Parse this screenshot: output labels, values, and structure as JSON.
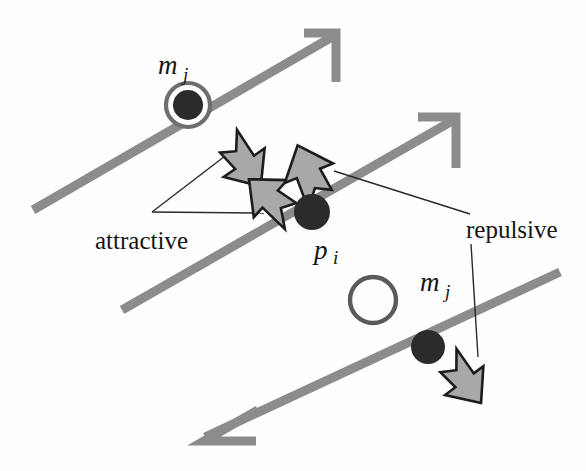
{
  "figure": {
    "background_color": "#fefefe"
  },
  "colors": {
    "trajectory": "#8c8c8c",
    "force_arrow_fill": "#a8a8a8",
    "force_arrow_stroke": "#1c1c1c",
    "node_fill": "#2b2b2b",
    "node_ring": "#6e6e6e",
    "leader_line": "#2a2a2a",
    "text": "#141414"
  },
  "labels": {
    "attractive": "attractive",
    "repulsive": "repulsive",
    "m_top": {
      "base": "m",
      "sub": "j"
    },
    "m_bottom": {
      "base": "m",
      "sub": "j"
    },
    "p_center": {
      "base": "p",
      "sub": "i"
    }
  },
  "trajectories": [
    {
      "name": "upper-trajectory",
      "x1": 33,
      "y1": 210,
      "x2": 330,
      "y2": 38,
      "arrow_direction": "up-right"
    },
    {
      "name": "middle-trajectory",
      "x1": 122,
      "y1": 310,
      "x2": 450,
      "y2": 122,
      "arrow_direction": "up-right"
    },
    {
      "name": "lower-trajectory",
      "x1": 205,
      "y1": 435,
      "x2": 560,
      "y2": 272,
      "arrow_direction": "down-left"
    }
  ],
  "nodes": [
    {
      "name": "m-j-upper",
      "type": "ringed-dot",
      "cx": 188,
      "cy": 105,
      "r": 15,
      "ring_r": 23
    },
    {
      "name": "p-i-center",
      "type": "filled-dot",
      "cx": 312,
      "cy": 212,
      "r": 18
    },
    {
      "name": "open-circle",
      "type": "open-circle",
      "cx": 373,
      "cy": 300,
      "r": 24
    },
    {
      "name": "m-j-lower",
      "type": "filled-dot",
      "cx": 428,
      "cy": 347,
      "r": 17
    }
  ],
  "force_arrows": [
    {
      "name": "attractive-arrow-upper",
      "force": "attractive",
      "cx": 243,
      "cy": 163,
      "angle": 135,
      "scale": 1.0
    },
    {
      "name": "attractive-arrow-lower",
      "force": "attractive",
      "cx": 273,
      "cy": 200,
      "angle": -50,
      "scale": 0.92
    },
    {
      "name": "repulsive-arrow-center",
      "force": "repulsive",
      "cx": 309,
      "cy": 177,
      "angle": -23,
      "scale": 1.0
    },
    {
      "name": "repulsive-arrow-lower",
      "force": "repulsive",
      "cx": 464,
      "cy": 380,
      "angle": 140,
      "scale": 0.95
    }
  ],
  "leader_lines": [
    {
      "name": "attractive-leader-to-upper-arrow",
      "x1": 152,
      "y1": 212,
      "x2": 228,
      "y2": 154
    },
    {
      "name": "attractive-leader-to-lower-arrow",
      "x1": 152,
      "y1": 212,
      "x2": 262,
      "y2": 213
    },
    {
      "name": "repulsive-leader-to-center-arrow",
      "x1": 335,
      "y1": 172,
      "x2": 470,
      "y2": 213
    },
    {
      "name": "repulsive-leader-to-lower-arrow",
      "x1": 471,
      "y1": 243,
      "x2": 477,
      "y2": 356
    }
  ],
  "label_positions": {
    "attractive": {
      "x": 97,
      "y": 243
    },
    "repulsive": {
      "x": 468,
      "y": 232
    },
    "m_top": {
      "x": 158,
      "y": 72
    },
    "m_bottom": {
      "x": 419,
      "y": 288
    },
    "p_center": {
      "x": 318,
      "y": 256
    }
  }
}
